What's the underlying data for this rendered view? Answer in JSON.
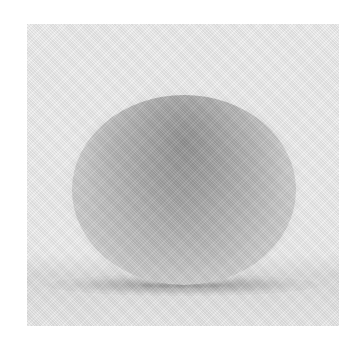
{
  "image": {
    "subject": "Rendered grayscale sphere on a light surface with soft contact shadow",
    "background_color": "#ffffff",
    "frame_color": "#efefef",
    "sphere_color": "#c0c0c0",
    "shadow_color": "#3c3c3c",
    "caption": "Noisy path-traced gray sphere"
  }
}
